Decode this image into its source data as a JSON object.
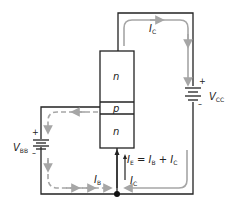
{
  "diagram": {
    "regions": {
      "collector": "n",
      "base": "p",
      "emitter": "n"
    },
    "sources": {
      "vcc": {
        "symbol": "V",
        "sub": "CC",
        "plus": "+",
        "minus": "–"
      },
      "vbb": {
        "symbol": "V",
        "sub": "BB",
        "plus": "+",
        "minus": "–"
      }
    },
    "currents": {
      "ic_top": {
        "symbol": "I",
        "sub": "C"
      },
      "ic_bottom": {
        "symbol": "I",
        "sub": "C"
      },
      "ib": {
        "symbol": "I",
        "sub": "B"
      },
      "ie_equation": {
        "lhs": "I",
        "lhs_sub": "E",
        "eq": " = ",
        "t1": "I",
        "t1_sub": "B",
        "plus": " + ",
        "t2": "I",
        "t2_sub": "C"
      }
    },
    "colors": {
      "wire": "#222222",
      "current_arrow": "#a6a6a6"
    }
  }
}
